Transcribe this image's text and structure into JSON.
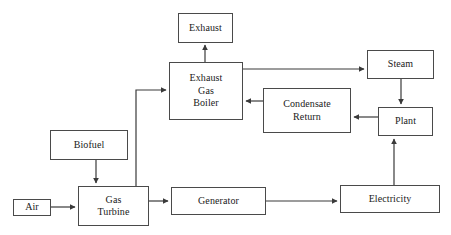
{
  "diagram": {
    "type": "flowchart",
    "background_color": "#ffffff",
    "box_border_color": "#4a4a4a",
    "box_fill_color": "#ffffff",
    "connector_color": "#3a3a3a",
    "text_color": "#1a1a1a",
    "nodes": [
      {
        "id": "exhaust",
        "label": "Exhaust",
        "x": 178,
        "y": 13,
        "w": 55,
        "h": 30
      },
      {
        "id": "boiler",
        "label": "Exhaust\nGas\nBoiler",
        "x": 169,
        "y": 62,
        "w": 74,
        "h": 58
      },
      {
        "id": "steam",
        "label": "Steam",
        "x": 367,
        "y": 50,
        "w": 67,
        "h": 29
      },
      {
        "id": "condensate",
        "label": "Condensate\nReturn",
        "x": 263,
        "y": 88,
        "w": 88,
        "h": 45
      },
      {
        "id": "plant",
        "label": "Plant",
        "x": 378,
        "y": 107,
        "w": 55,
        "h": 29
      },
      {
        "id": "biofuel",
        "label": "Biofuel",
        "x": 50,
        "y": 130,
        "w": 78,
        "h": 30
      },
      {
        "id": "air",
        "label": "Air",
        "x": 13,
        "y": 199,
        "w": 38,
        "h": 17
      },
      {
        "id": "turbine",
        "label": "Gas\nTurbine",
        "x": 78,
        "y": 186,
        "w": 71,
        "h": 40
      },
      {
        "id": "generator",
        "label": "Generator",
        "x": 171,
        "y": 187,
        "w": 95,
        "h": 28
      },
      {
        "id": "electricity",
        "label": "Electricity",
        "x": 340,
        "y": 185,
        "w": 100,
        "h": 28
      }
    ],
    "connectors": [
      {
        "id": "boiler-to-exhaust",
        "from": "boiler",
        "to": "exhaust",
        "arrow": "up"
      },
      {
        "id": "turbine-to-boiler",
        "from": "turbine",
        "to": "boiler",
        "arrow": "right"
      },
      {
        "id": "boiler-to-steam",
        "from": "boiler",
        "to": "steam",
        "arrow": "right"
      },
      {
        "id": "steam-to-plant",
        "from": "steam",
        "to": "plant",
        "arrow": "down"
      },
      {
        "id": "plant-to-condensate",
        "from": "plant",
        "to": "condensate",
        "arrow": "left"
      },
      {
        "id": "condensate-to-boiler",
        "from": "condensate",
        "to": "boiler",
        "arrow": "left"
      },
      {
        "id": "biofuel-to-turbine",
        "from": "biofuel",
        "to": "turbine",
        "arrow": "down"
      },
      {
        "id": "air-to-turbine",
        "from": "air",
        "to": "turbine",
        "arrow": "right"
      },
      {
        "id": "turbine-to-generator",
        "from": "turbine",
        "to": "generator",
        "arrow": "right"
      },
      {
        "id": "generator-to-electricity",
        "from": "generator",
        "to": "electricity",
        "arrow": "right"
      },
      {
        "id": "electricity-to-plant",
        "from": "electricity",
        "to": "plant",
        "arrow": "up"
      }
    ]
  }
}
